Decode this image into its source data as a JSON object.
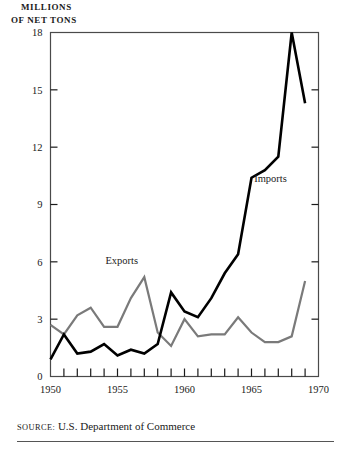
{
  "figure": {
    "axis_title_line1": "MILLIONS",
    "axis_title_line2": "OF NET TONS",
    "source_prefix": "SOURCE:",
    "source_text": "U.S. Department of Commerce"
  },
  "chart_data": {
    "type": "line",
    "title": "",
    "subtitle": "",
    "xlabel": "",
    "ylabel": "MILLIONS OF NET TONS",
    "xlim": [
      1950,
      1970
    ],
    "ylim": [
      0,
      18
    ],
    "yticks": [
      0,
      3,
      6,
      9,
      12,
      15,
      18
    ],
    "xticks": [
      1950,
      1951,
      1952,
      1953,
      1954,
      1955,
      1956,
      1957,
      1958,
      1959,
      1960,
      1961,
      1962,
      1963,
      1964,
      1965,
      1966,
      1967,
      1968,
      1969,
      1970
    ],
    "xtick_labels_shown": [
      1950,
      1955,
      1960,
      1965,
      1970
    ],
    "minor_tick_interval": 1,
    "grid": false,
    "legend_position": "inline-annotations",
    "x": [
      1950,
      1951,
      1952,
      1953,
      1954,
      1955,
      1956,
      1957,
      1958,
      1959,
      1960,
      1961,
      1962,
      1963,
      1964,
      1965,
      1966,
      1967,
      1968,
      1969
    ],
    "series": [
      {
        "name": "Exports",
        "color": "#7a7a7a",
        "linewidth": 2.2,
        "label_x": 1954.1,
        "label_y": 5.9,
        "values": [
          2.7,
          2.2,
          3.2,
          3.6,
          2.6,
          2.6,
          4.1,
          5.2,
          2.3,
          1.6,
          3.0,
          2.1,
          2.2,
          2.2,
          3.1,
          2.3,
          1.8,
          1.8,
          2.1,
          5.0
        ]
      },
      {
        "name": "Imports",
        "color": "#000000",
        "linewidth": 2.6,
        "label_x": 1965.2,
        "label_y": 10.2,
        "values": [
          0.9,
          2.2,
          1.2,
          1.3,
          1.7,
          1.1,
          1.4,
          1.2,
          1.7,
          4.4,
          3.4,
          3.1,
          4.1,
          5.4,
          6.4,
          10.4,
          10.8,
          11.5,
          18.0,
          14.3
        ]
      }
    ],
    "annotations": [
      {
        "text": "Exports",
        "x": 1954.1,
        "y": 5.9
      },
      {
        "text": "Imports",
        "x": 1965.2,
        "y": 10.2
      }
    ]
  }
}
